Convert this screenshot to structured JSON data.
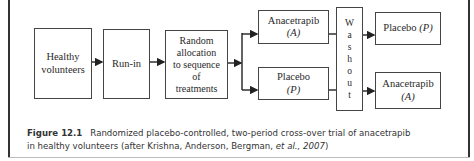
{
  "diagram": {
    "nodes": {
      "healthy": {
        "label_line1": "Healthy",
        "label_line2": "volunteers"
      },
      "runin": {
        "label": "Run-in"
      },
      "random": {
        "lines": [
          "Random",
          "allocation",
          "to sequence",
          "of",
          "treatments"
        ]
      },
      "anacetrapib_1": {
        "label": "Anacetrapib",
        "code": "(A)"
      },
      "placebo_1": {
        "label": "Placebo",
        "code": "(P)"
      },
      "washout": {
        "letters": [
          "W",
          "a",
          "s",
          "h",
          "o",
          "u",
          "t"
        ]
      },
      "placebo_2": {
        "label": "Placebo",
        "code": "(P)"
      },
      "anacetrapib_2": {
        "label": "Anacetrapib",
        "code": "(A)"
      }
    },
    "edges": [
      [
        "healthy",
        "runin"
      ],
      [
        "runin",
        "random"
      ],
      [
        "random",
        "anacetrapib_1"
      ],
      [
        "random",
        "placebo_1"
      ],
      [
        "anacetrapib_1",
        "washout"
      ],
      [
        "placebo_1",
        "washout"
      ],
      [
        "washout",
        "placebo_2"
      ],
      [
        "washout",
        "anacetrapib_2"
      ]
    ]
  },
  "caption": {
    "figure_label": "Figure 12.1",
    "text_line1": "Randomized placebo-controlled, two-period cross-over trial of anacetrapib",
    "text_line2_prefix": "in healthy volunteers (after Krishna, Anderson, Bergman, ",
    "text_line2_italic": "et al., 2007",
    "text_line2_suffix": ")"
  }
}
